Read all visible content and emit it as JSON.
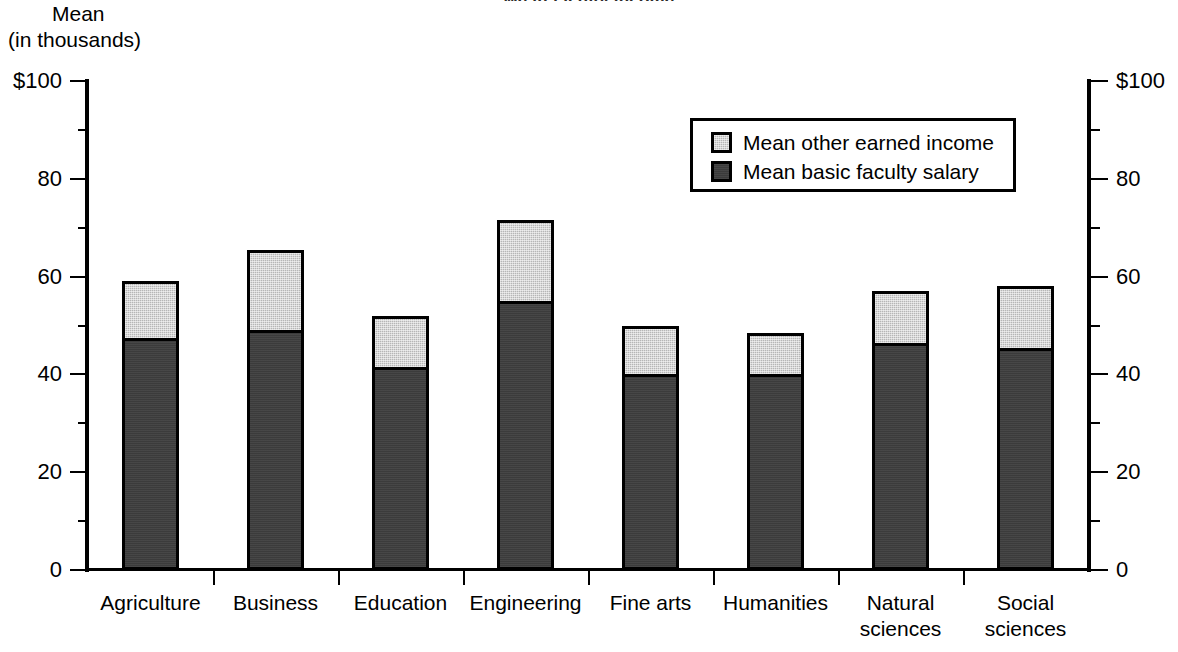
{
  "title": "Mean faculty income",
  "axis": {
    "y_title_line1": "Mean",
    "y_title_line2": "(in thousands)",
    "y_ticks": [
      "$100",
      "80",
      "60",
      "40",
      "20",
      "0"
    ],
    "y_tick_values": [
      100,
      80,
      60,
      40,
      20,
      0
    ],
    "y_minor_values": [
      90,
      70,
      50,
      30,
      10
    ],
    "y_min": 0,
    "y_max": 100,
    "right_axis_ticks": [
      "$100",
      "80",
      "60",
      "40",
      "20",
      "0"
    ]
  },
  "legend": {
    "position": "top-right-inside",
    "items": [
      {
        "label": "Mean other earned income",
        "color": "#b6b6b6"
      },
      {
        "label": "Mean basic faculty salary",
        "color": "#3b3b3b"
      }
    ]
  },
  "chart_data": {
    "type": "bar",
    "subtype": "stacked",
    "title": "Mean faculty income",
    "xlabel": "",
    "ylabel": "Mean (in thousands)",
    "ylim": [
      0,
      100
    ],
    "grid": false,
    "legend_position": "top-right-inside",
    "categories": [
      "Agriculture",
      "Business",
      "Education",
      "Engineering",
      "Fine arts",
      "Humanities",
      "Natural sciences",
      "Social sciences"
    ],
    "category_label_lines": [
      [
        "Agriculture"
      ],
      [
        "Business"
      ],
      [
        "Education"
      ],
      [
        "Engineering"
      ],
      [
        "Fine arts"
      ],
      [
        "Humanities"
      ],
      [
        "Natural",
        "sciences"
      ],
      [
        "Social",
        "sciences"
      ]
    ],
    "series": [
      {
        "name": "Mean basic faculty salary",
        "color": "#3b3b3b",
        "values": [
          47.5,
          49.0,
          41.5,
          55.0,
          40.0,
          40.0,
          46.5,
          45.5
        ]
      },
      {
        "name": "Mean other earned income",
        "color": "#b6b6b6",
        "values": [
          11.5,
          16.5,
          10.5,
          16.5,
          10.0,
          8.5,
          10.5,
          12.5
        ]
      }
    ],
    "totals": [
      59.0,
      65.5,
      52.0,
      71.5,
      50.0,
      48.5,
      57.0,
      58.0
    ]
  }
}
